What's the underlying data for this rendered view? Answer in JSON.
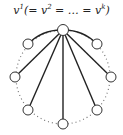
{
  "label": {
    "v": "v",
    "sup1": "1",
    "mid1": "(= ",
    "v2": "v",
    "sup2": "2",
    "mid2": " = … = ",
    "vk": "v",
    "supk": "k",
    "close": ")"
  },
  "graph": {
    "colors": {
      "edge": "#222222",
      "node_stroke": "#333333",
      "node_fill": "#ffffff",
      "dotted": "#777777"
    },
    "center_node": {
      "id": "v1",
      "x": 63,
      "y": 30
    },
    "nodes": [
      {
        "id": "upper-left",
        "x": 28,
        "y": 44
      },
      {
        "id": "upper-right",
        "x": 97,
        "y": 44
      },
      {
        "id": "mid-left",
        "x": 15,
        "y": 77
      },
      {
        "id": "mid-right",
        "x": 111,
        "y": 77
      },
      {
        "id": "lower-left",
        "x": 28,
        "y": 110
      },
      {
        "id": "lower-right",
        "x": 97,
        "y": 110
      },
      {
        "id": "bottom",
        "x": 63,
        "y": 124
      }
    ],
    "solid_arcs_to": [
      "upper-left",
      "upper-right"
    ],
    "straight_edges_to": [
      "mid-left",
      "mid-right",
      "lower-left",
      "lower-right",
      "bottom"
    ],
    "dotted_circle": true
  }
}
